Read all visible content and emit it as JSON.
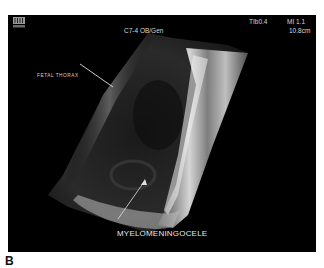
{
  "figure": {
    "panel_letter": "B"
  },
  "header": {
    "logo_icon": "scanner-logo-icon",
    "probe_preset": "C7-4 OB/Gen",
    "tib": "TIb0.4",
    "mi": "MI 1.1",
    "depth": "10.8cm"
  },
  "annotations": {
    "fetal_thorax": "FETAL THORAX",
    "myelomeningocele": "MYELOMENINGOCELE"
  },
  "colors": {
    "background": "#000000",
    "text": "#d8d8d8",
    "page": "#ffffff"
  }
}
